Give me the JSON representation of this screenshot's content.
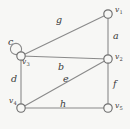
{
  "figure": {
    "name": "undirected-graph-diagram",
    "background_color": "#f7f7f5",
    "line_color": "#8a8a8a",
    "label_color": "#3a3a3a",
    "width": 130,
    "height": 129
  },
  "graph": {
    "type": "undirected-multigraph",
    "vertices": [
      {
        "id": "v1",
        "label": "v",
        "subscript": "1",
        "x": 108,
        "y": 14,
        "label_x": 115,
        "label_y": 6
      },
      {
        "id": "v2",
        "label": "v",
        "subscript": "2",
        "x": 108,
        "y": 59,
        "label_x": 115,
        "label_y": 53
      },
      {
        "id": "v3",
        "label": "v",
        "subscript": "3",
        "x": 21,
        "y": 56,
        "label_x": 22,
        "label_y": 58
      },
      {
        "id": "v4",
        "label": "v",
        "subscript": "4",
        "x": 21,
        "y": 108,
        "label_x": 9,
        "label_y": 97
      },
      {
        "id": "v5",
        "label": "v",
        "subscript": "5",
        "x": 108,
        "y": 108,
        "label_x": 115,
        "label_y": 102
      }
    ],
    "edges": [
      {
        "id": "a",
        "label": "a",
        "from": "v1",
        "to": "v2",
        "shape": "line",
        "label_x": 113,
        "label_y": 31
      },
      {
        "id": "b",
        "label": "b",
        "from": "v3",
        "to": "v2",
        "shape": "line",
        "label_x": 58,
        "label_y": 62
      },
      {
        "id": "c",
        "label": "c",
        "from": "v3",
        "to": "v3",
        "shape": "loop",
        "loop_cx": 16,
        "loop_cy": 49,
        "loop_r": 5.6,
        "label_x": 8,
        "label_y": 37
      },
      {
        "id": "d",
        "label": "d",
        "from": "v3",
        "to": "v4",
        "shape": "line",
        "label_x": 11,
        "label_y": 74
      },
      {
        "id": "e",
        "label": "e",
        "from": "v2",
        "to": "v4",
        "shape": "line",
        "label_x": 63,
        "label_y": 74
      },
      {
        "id": "f",
        "label": "f",
        "from": "v2",
        "to": "v5",
        "shape": "line",
        "label_x": 113,
        "label_y": 79
      },
      {
        "id": "g",
        "label": "g",
        "from": "v1",
        "to": "v3",
        "shape": "line",
        "label_x": 56,
        "label_y": 15
      },
      {
        "id": "h",
        "label": "h",
        "from": "v4",
        "to": "v5",
        "shape": "line",
        "label_x": 60,
        "label_y": 99
      }
    ]
  }
}
